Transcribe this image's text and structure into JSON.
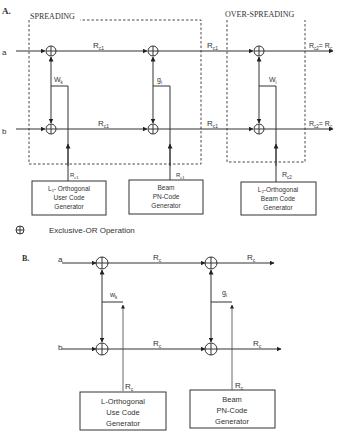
{
  "figure": {
    "panel_a": {
      "label": "A.",
      "spreading_title": "SPREADING",
      "overspreading_title": "OVER-SPREADING",
      "input_a": "a",
      "input_b": "b",
      "rate_rc1": "R",
      "rate_rc1_sub": "c1",
      "rate_rc2": "R",
      "rate_rc2_sub": "c2",
      "output_eq": "= R",
      "output_eq_sub": "c",
      "wk": "W",
      "wk_sub": "k",
      "gi": "g",
      "gi_sub": "i",
      "wi": "W",
      "wi_sub": "i",
      "gen1_lines": [
        "L₁- Orthogonal",
        "User Code",
        "Generator"
      ],
      "gen2_lines": [
        "Beam",
        "PN-Code",
        "Generator"
      ],
      "gen3_lines": [
        "L₂-Orthogonal",
        "Beam Code",
        "Generator"
      ]
    },
    "legend": {
      "symbol": "⊕",
      "text": "Exclusive-OR Operation"
    },
    "panel_b": {
      "label": "B.",
      "input_a": "a",
      "input_b": "b",
      "rate": "R",
      "rate_sub": "c",
      "wk": "w",
      "wk_sub": "k",
      "gi": "g",
      "gi_sub": "i",
      "gen1_lines": [
        "L-Orthogonal",
        "Use Code",
        "Generator"
      ],
      "gen2_lines": [
        "Beam",
        "PN-Code",
        "Generator"
      ]
    }
  }
}
